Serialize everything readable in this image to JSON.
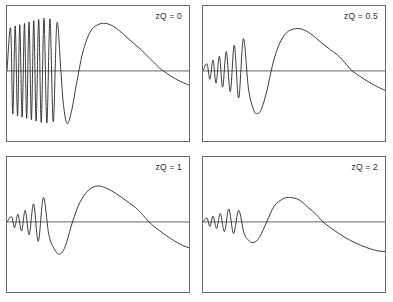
{
  "figure": {
    "width": 393,
    "height": 302,
    "background": "#ffffff",
    "panel_border_color": "#6b6b6b",
    "curve_color": "#1a1a1a",
    "axis_color": "#555555",
    "panels": [
      {
        "id": "panel-top-left",
        "label": "zQ = 0",
        "x": 6,
        "y": 5,
        "w": 184,
        "h": 137,
        "zero_line_y_frac": 0.481
      },
      {
        "id": "panel-top-right",
        "label": "zQ = 0.5",
        "x": 202,
        "y": 5,
        "w": 184,
        "h": 137,
        "zero_line_y_frac": 0.481
      },
      {
        "id": "panel-bottom-left",
        "label": "zQ = 1",
        "x": 6,
        "y": 156,
        "w": 184,
        "h": 137,
        "zero_line_y_frac": 0.481
      },
      {
        "id": "panel-bottom-right",
        "label": "zQ = 2",
        "x": 202,
        "y": 156,
        "w": 184,
        "h": 137,
        "zero_line_y_frac": 0.481
      }
    ]
  },
  "chart_data": {
    "type": "line",
    "title": "",
    "xlabel": "",
    "ylabel": "",
    "grid": false,
    "legend": "none",
    "axis_ticks": "none",
    "shared_description": "Four panels of a damped oscillatory response curve; each panel plots one unlabelled signal versus an unlabelled horizontal axis with a horizontal zero reference line. Oscillation damping increases with zQ.",
    "panels": [
      {
        "label": "zQ = 0",
        "zQ": 0,
        "xlim": [
          0,
          1
        ],
        "ylim": [
          -1,
          1
        ],
        "zero_line": 0,
        "n_visible_oscillations": 5,
        "oscillation_region_x": [
          0.02,
          0.36
        ],
        "main_peak": {
          "x": 0.54,
          "y": 0.74
        },
        "main_trough": {
          "x": 0.31,
          "y": -0.82
        },
        "zero_crossing_after_peak_x": 0.86,
        "value_at_right_edge": -0.22,
        "series": [
          {
            "name": "signal",
            "x": [
              0.0,
              0.02,
              0.032,
              0.045,
              0.058,
              0.07,
              0.083,
              0.096,
              0.108,
              0.121,
              0.134,
              0.147,
              0.16,
              0.174,
              0.188,
              0.203,
              0.219,
              0.236,
              0.254,
              0.274,
              0.296,
              0.31,
              0.33,
              0.355,
              0.385,
              0.42,
              0.46,
              0.5,
              0.54,
              0.58,
              0.62,
              0.66,
              0.7,
              0.74,
              0.79,
              0.84,
              0.86,
              0.9,
              0.95,
              1.0
            ],
            "y": [
              0.0,
              0.66,
              -0.67,
              0.7,
              -0.7,
              0.72,
              -0.72,
              0.74,
              -0.74,
              0.76,
              -0.76,
              0.78,
              -0.78,
              0.8,
              -0.8,
              0.82,
              -0.81,
              0.81,
              -0.79,
              0.74,
              0.0,
              -0.52,
              -0.82,
              -0.62,
              -0.15,
              0.33,
              0.62,
              0.72,
              0.74,
              0.7,
              0.62,
              0.52,
              0.42,
              0.32,
              0.18,
              0.04,
              0.0,
              -0.08,
              -0.16,
              -0.22
            ]
          }
        ]
      },
      {
        "label": "zQ = 0.5",
        "zQ": 0.5,
        "xlim": [
          0,
          1
        ],
        "ylim": [
          -1,
          1
        ],
        "zero_line": 0,
        "n_visible_oscillations": 5,
        "oscillation_region_x": [
          0.02,
          0.36
        ],
        "main_peak": {
          "x": 0.52,
          "y": 0.66
        },
        "main_trough": {
          "x": 0.3,
          "y": -0.66
        },
        "zero_crossing_after_peak_x": 0.82,
        "value_at_right_edge": -0.3,
        "series": [
          {
            "name": "signal",
            "x": [
              0.0,
              0.022,
              0.038,
              0.055,
              0.072,
              0.09,
              0.108,
              0.128,
              0.15,
              0.172,
              0.196,
              0.222,
              0.25,
              0.28,
              0.3,
              0.32,
              0.35,
              0.39,
              0.43,
              0.47,
              0.52,
              0.56,
              0.6,
              0.65,
              0.7,
              0.75,
              0.8,
              0.82,
              0.86,
              0.91,
              0.96,
              1.0
            ],
            "y": [
              0.0,
              0.11,
              -0.13,
              0.17,
              -0.19,
              0.23,
              -0.25,
              0.3,
              -0.32,
              0.4,
              -0.42,
              0.5,
              -0.28,
              -0.62,
              -0.66,
              -0.6,
              -0.32,
              0.18,
              0.48,
              0.62,
              0.66,
              0.63,
              0.56,
              0.44,
              0.33,
              0.22,
              0.06,
              0.0,
              -0.08,
              -0.17,
              -0.25,
              -0.3
            ]
          }
        ]
      },
      {
        "label": "zQ = 1",
        "zQ": 1,
        "xlim": [
          0,
          1
        ],
        "ylim": [
          -1,
          1
        ],
        "zero_line": 0,
        "n_visible_oscillations": 4,
        "oscillation_region_x": [
          0.02,
          0.34
        ],
        "main_peak": {
          "x": 0.5,
          "y": 0.56
        },
        "main_trough": {
          "x": 0.29,
          "y": -0.5
        },
        "zero_crossing_after_peak_x": 0.78,
        "value_at_right_edge": -0.4,
        "series": [
          {
            "name": "signal",
            "x": [
              0.0,
              0.025,
              0.042,
              0.06,
              0.08,
              0.1,
              0.122,
              0.146,
              0.172,
              0.2,
              0.23,
              0.26,
              0.29,
              0.32,
              0.36,
              0.4,
              0.45,
              0.5,
              0.55,
              0.6,
              0.66,
              0.72,
              0.78,
              0.84,
              0.9,
              0.96,
              1.0
            ],
            "y": [
              0.0,
              0.08,
              -0.09,
              0.12,
              -0.14,
              0.18,
              -0.2,
              0.28,
              -0.3,
              0.38,
              -0.2,
              -0.42,
              -0.5,
              -0.38,
              0.0,
              0.3,
              0.5,
              0.56,
              0.52,
              0.44,
              0.32,
              0.19,
              0.0,
              -0.14,
              -0.26,
              -0.36,
              -0.4
            ]
          }
        ]
      },
      {
        "label": "zQ = 2",
        "zQ": 2,
        "xlim": [
          0,
          1
        ],
        "ylim": [
          -1,
          1
        ],
        "zero_line": 0,
        "n_visible_oscillations": 4,
        "oscillation_region_x": [
          0.02,
          0.32
        ],
        "main_peak": {
          "x": 0.48,
          "y": 0.38
        },
        "main_trough": {
          "x": 0.28,
          "y": -0.32
        },
        "zero_crossing_after_peak_x": 0.66,
        "value_at_right_edge": -0.46,
        "series": [
          {
            "name": "signal",
            "x": [
              0.0,
              0.022,
              0.038,
              0.055,
              0.075,
              0.095,
              0.118,
              0.142,
              0.168,
              0.196,
              0.226,
              0.256,
              0.28,
              0.31,
              0.35,
              0.39,
              0.44,
              0.48,
              0.53,
              0.58,
              0.62,
              0.66,
              0.72,
              0.78,
              0.84,
              0.9,
              0.96,
              1.0
            ],
            "y": [
              0.0,
              0.06,
              -0.07,
              0.09,
              -0.1,
              0.13,
              -0.15,
              0.2,
              -0.18,
              0.18,
              -0.18,
              -0.3,
              -0.32,
              -0.24,
              0.0,
              0.24,
              0.36,
              0.38,
              0.34,
              0.22,
              0.12,
              0.0,
              -0.13,
              -0.24,
              -0.33,
              -0.4,
              -0.45,
              -0.46
            ]
          }
        ]
      }
    ]
  }
}
